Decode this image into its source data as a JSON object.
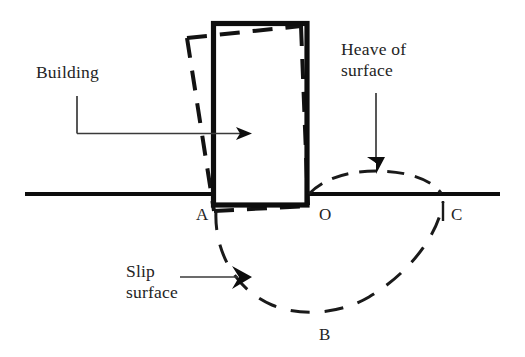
{
  "figure": {
    "background_color": "#ffffff",
    "ink_color": "#0d0d0d",
    "width": 525,
    "height": 357
  },
  "annotations": {
    "building": {
      "label": "Building",
      "line1": "Building",
      "x": 36,
      "y": 78
    },
    "heave": {
      "label": "Heave of surface",
      "line1": "Heave of",
      "line2": "surface",
      "x": 341,
      "y1": 55,
      "y2": 76
    },
    "slip": {
      "label": "Slip surface",
      "line1": "Slip",
      "line2": "surface",
      "x": 126,
      "y1": 277,
      "y2": 298
    }
  },
  "points": [
    {
      "id": "A",
      "label": "A",
      "x": 196,
      "y": 220,
      "note": "toe of slip circle at left edge of building"
    },
    {
      "id": "O",
      "label": "O",
      "x": 319,
      "y": 220,
      "note": "right edge of building at ground level"
    },
    {
      "id": "B",
      "label": "B",
      "x": 319,
      "y": 340,
      "note": "lowest point of slip circle"
    },
    {
      "id": "C",
      "label": "C",
      "x": 451,
      "y": 220,
      "note": "far end of slip circle on ground surface"
    }
  ],
  "elements": {
    "ground_line_left": {
      "name": "ground-surface-left",
      "x1": 25,
      "y1": 194,
      "x2": 213,
      "y2": 194
    },
    "ground_line_right": {
      "name": "ground-surface-right",
      "x1": 307,
      "y1": 194,
      "x2": 500,
      "y2": 194
    },
    "building_solid": {
      "name": "building-upright",
      "x": 213,
      "y": 23,
      "width": 94,
      "height": 182
    },
    "building_tilted": {
      "name": "building-tilted-dashed",
      "description": "dashed outline of rotated building"
    },
    "slip_circle": {
      "name": "slip-surface-arc",
      "description": "dashed circular arc A-B-C"
    },
    "heave_arc": {
      "name": "heave-arc",
      "description": "dashed bulge of ground surface between O and C"
    },
    "tilt_arrow": {
      "name": "tilt-direction-arrow",
      "description": "horizontal arrow through building showing movement"
    },
    "heave_arrow": {
      "name": "heave-pointer-arrow",
      "description": "vertical down arrow to heave crest"
    },
    "slip_arrow": {
      "name": "slip-pointer-arrow",
      "description": "horizontal arrow to slip surface"
    },
    "c_tick": {
      "name": "point-c-tick",
      "x": 443,
      "y1": 200,
      "y2": 222
    }
  }
}
